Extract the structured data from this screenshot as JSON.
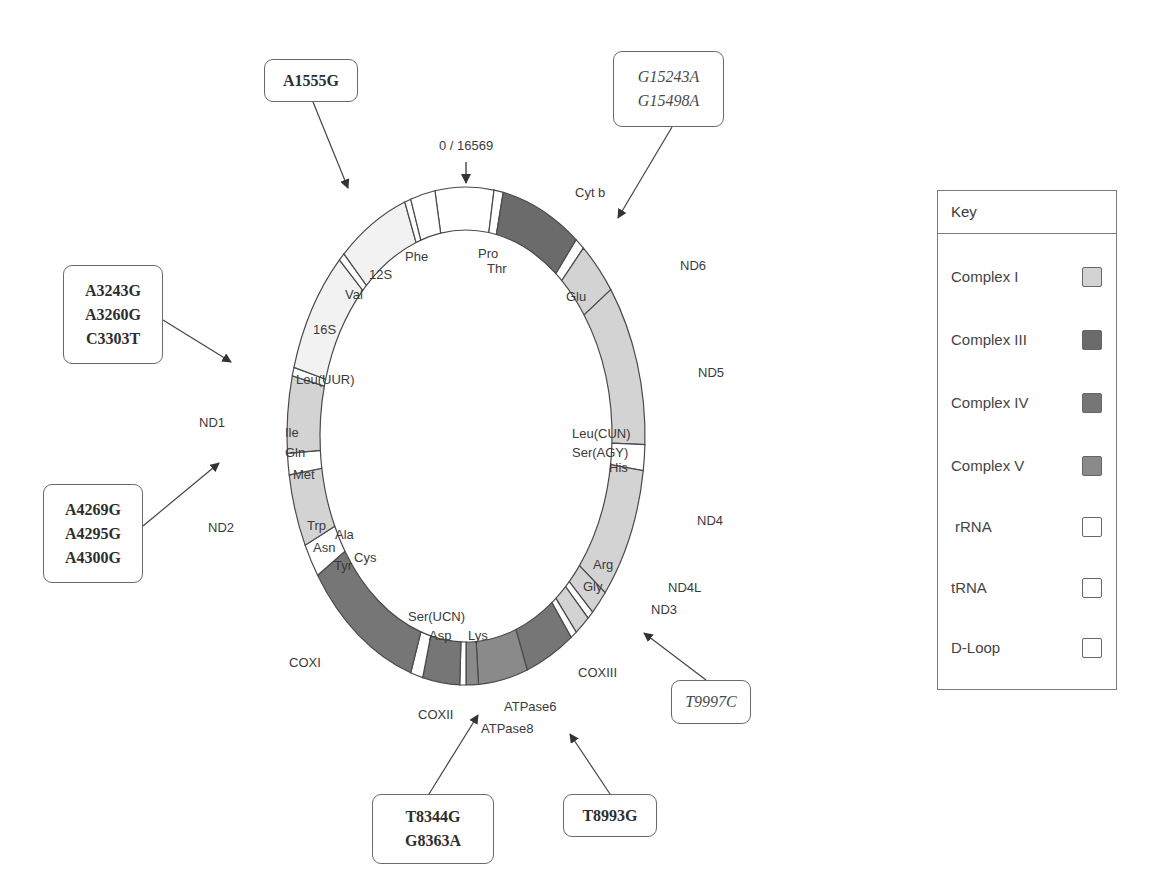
{
  "diagram": {
    "origin_label": "0 / 16569",
    "colors": {
      "complex_I": "#d3d3d3",
      "complex_III": "#6b6b6b",
      "complex_IV": "#767676",
      "complex_V": "#8a8a8a",
      "rRNA": "#f2f2f2",
      "tRNA": "#ffffff",
      "d_loop": "#ffffff",
      "outline": "#4a4a4a"
    },
    "outer_labels": {
      "cytb": "Cyt b",
      "nd6": "ND6",
      "nd5": "ND5",
      "nd4": "ND4",
      "nd4l": "ND4L",
      "nd3": "ND3",
      "coxiii": "COXIII",
      "atpase6": "ATPase6",
      "atpase8": "ATPase8",
      "coxii": "COXII",
      "coxi": "COXI",
      "nd2": "ND2",
      "nd1": "ND1"
    },
    "inner_labels": {
      "phe": "Phe",
      "s12": "12S",
      "val": "Val",
      "s16": "16S",
      "leu_uur": "Leu(UUR)",
      "ile": "Ile",
      "gln": "Gln",
      "met": "Met",
      "trp": "Trp",
      "ala": "Ala",
      "asn": "Asn",
      "cys": "Cys",
      "tyr": "Tyr",
      "ser_ucn": "Ser(UCN)",
      "asp": "Asp",
      "lys": "Lys",
      "gly": "Gly",
      "arg": "Arg",
      "his": "His",
      "ser_agy": "Ser(AGY)",
      "leu_cun": "Leu(CUN)",
      "glu": "Glu",
      "pro": "Pro",
      "thr": "Thr"
    }
  },
  "mutations": {
    "a1555g": {
      "lines": [
        "A1555G"
      ]
    },
    "g15243a": {
      "lines": [
        "G15243A",
        "G15498A"
      ]
    },
    "a3243g": {
      "lines": [
        "A3243G",
        "A3260G",
        "C3303T"
      ]
    },
    "a4269g": {
      "lines": [
        "A4269G",
        "A4295G",
        "A4300G"
      ]
    },
    "t9997c": {
      "lines": [
        "T9997C"
      ]
    },
    "t8344g": {
      "lines": [
        "T8344G",
        "G8363A"
      ]
    },
    "t8993g": {
      "lines": [
        "T8993G"
      ]
    }
  },
  "legend": {
    "title": "Key",
    "items": [
      {
        "label": "Complex I",
        "color": "#d3d3d3"
      },
      {
        "label": "Complex III",
        "color": "#6b6b6b"
      },
      {
        "label": "Complex IV",
        "color": "#767676"
      },
      {
        "label": "Complex V",
        "color": "#8a8a8a"
      },
      {
        "label": "rRNA",
        "color": "#ffffff"
      },
      {
        "label": "tRNA",
        "color": "#ffffff"
      },
      {
        "label": "D-Loop",
        "color": "#ffffff"
      }
    ]
  }
}
